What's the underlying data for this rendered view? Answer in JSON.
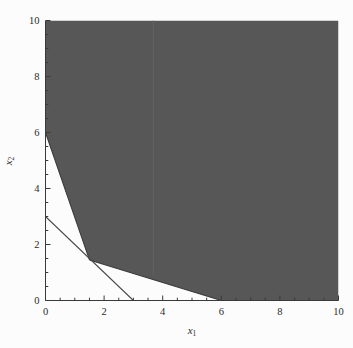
{
  "chart_data": {
    "type": "area",
    "title": "",
    "subtitle": "",
    "xlabel": "x₁",
    "ylabel": "x₂",
    "xlabel_base": "x",
    "xlabel_sub": "1",
    "ylabel_base": "x",
    "ylabel_sub": "2",
    "xlim": [
      0,
      10
    ],
    "ylim": [
      0,
      10
    ],
    "xticks": [
      0,
      2,
      4,
      6,
      8,
      10
    ],
    "yticks": [
      0,
      2,
      4,
      6,
      8,
      10
    ],
    "xtick_labels": [
      "0",
      "2",
      "4",
      "6",
      "8",
      "10"
    ],
    "ytick_labels": [
      "0",
      "2",
      "4",
      "6",
      "8",
      "10"
    ],
    "minor_tick_step": 0.5,
    "grid": false,
    "legend": null,
    "legend_position": "none",
    "shaded_region": {
      "name": "feasible-region",
      "fill_color": "#575757",
      "edge_color": "#3a3a3a",
      "vertices": [
        [
          0,
          10
        ],
        [
          0,
          6
        ],
        [
          1.5,
          1.45
        ],
        [
          6,
          0
        ],
        [
          10,
          0
        ],
        [
          10,
          10
        ]
      ]
    },
    "series": [
      {
        "name": "constraint-line-1",
        "type": "line",
        "color": "#3a3a3a",
        "x": [
          0,
          1.5
        ],
        "y": [
          6,
          1.45
        ]
      },
      {
        "name": "constraint-line-2",
        "type": "line",
        "color": "#3a3a3a",
        "x": [
          1.5,
          6
        ],
        "y": [
          1.45,
          0
        ]
      },
      {
        "name": "objective-line",
        "type": "line",
        "color": "#4a4a4a",
        "x": [
          0,
          3
        ],
        "y": [
          3,
          0
        ]
      }
    ],
    "annotations": [],
    "vertex_points": [
      {
        "label": "",
        "x": 0,
        "y": 6
      },
      {
        "label": "",
        "x": 1.5,
        "y": 1.45
      },
      {
        "label": "",
        "x": 6,
        "y": 0
      }
    ]
  },
  "figure": {
    "background_color": "#fcfcfc",
    "axis_color": "#3a3a3a",
    "text_color": "#2b2b2b",
    "width": 353,
    "height": 348
  }
}
